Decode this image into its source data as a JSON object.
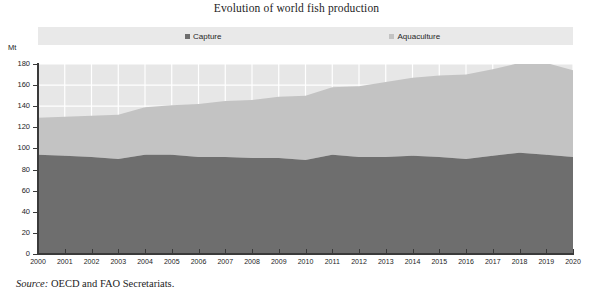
{
  "chart_data": {
    "type": "area",
    "stacked": true,
    "title": "Evolution of world fish production",
    "xlabel": "",
    "ylabel": "Mt",
    "ylim": [
      0,
      180
    ],
    "ytick_step": 20,
    "yticks": [
      "0",
      "20",
      "40",
      "60",
      "80",
      "100",
      "120",
      "140",
      "160",
      "180"
    ],
    "grid": true,
    "grid_color": "#ffffff",
    "legend_position": "top",
    "plot_background": "#e7e7e7",
    "x": [
      2000,
      2001,
      2002,
      2003,
      2004,
      2005,
      2006,
      2007,
      2008,
      2009,
      2010,
      2011,
      2012,
      2013,
      2014,
      2015,
      2016,
      2017,
      2018,
      2019,
      2020
    ],
    "categories": [
      "2000",
      "2001",
      "2002",
      "2003",
      "2004",
      "2005",
      "2006",
      "2007",
      "2008",
      "2009",
      "2010",
      "2011",
      "2012",
      "2013",
      "2014",
      "2015",
      "2016",
      "2017",
      "2018",
      "2019",
      "2020"
    ],
    "series": [
      {
        "name": "Capture",
        "color": "#6e6e6e",
        "values": [
          94,
          93,
          92,
          90,
          94,
          94,
          92,
          92,
          91,
          91,
          89,
          94,
          92,
          92,
          93,
          92,
          90,
          93,
          96,
          94,
          92
        ]
      },
      {
        "name": "Aquaculture",
        "color": "#c3c3c3",
        "values": [
          35,
          37,
          39,
          42,
          45,
          47,
          50,
          53,
          55,
          58,
          61,
          64,
          67,
          71,
          74,
          77,
          80,
          82,
          85,
          87,
          82
        ]
      }
    ],
    "totals": [
      129,
      130,
      131,
      132,
      139,
      141,
      142,
      145,
      146,
      149,
      150,
      158,
      159,
      163,
      167,
      169,
      170,
      175,
      181,
      181,
      174
    ]
  },
  "legend": {
    "entries": [
      {
        "label": "Capture",
        "color": "#6e6e6e"
      },
      {
        "label": "Aquaculture",
        "color": "#c3c3c3"
      }
    ]
  },
  "axis": {
    "unit_label": "Mt"
  },
  "source": {
    "label": "Source:",
    "text": "OECD and FAO Secretariats."
  }
}
